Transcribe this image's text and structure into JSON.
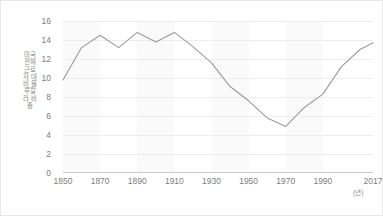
{
  "chart_data": {
    "type": "line",
    "title": "",
    "xlabel": "(년)",
    "ylabel": "미국 전체 근로자 대비 블루칼라 비중",
    "x": [
      1850,
      1860,
      1870,
      1880,
      1890,
      1900,
      1910,
      1920,
      1930,
      1940,
      1950,
      1960,
      1970,
      1980,
      1990,
      2000,
      2010,
      2017
    ],
    "values": [
      9.8,
      13.2,
      14.5,
      13.2,
      14.8,
      13.8,
      14.8,
      13.3,
      11.6,
      9.1,
      7.6,
      5.8,
      4.9,
      6.9,
      8.3,
      11.2,
      13.0,
      13.7
    ],
    "series": [
      {
        "name": "블루칼라 비중",
        "values": [
          9.8,
          13.2,
          14.5,
          13.2,
          14.8,
          13.8,
          14.8,
          13.3,
          11.6,
          9.1,
          7.6,
          5.8,
          4.9,
          6.9,
          8.3,
          11.2,
          13.0,
          13.7
        ],
        "color": "#9a9a9a"
      }
    ],
    "xlim": [
      1850,
      2017
    ],
    "ylim": [
      0,
      16
    ],
    "yticks": [
      "0",
      "2",
      "4",
      "6",
      "8",
      "10",
      "12",
      "14",
      "16"
    ],
    "ytick_values": [
      0,
      2,
      4,
      6,
      8,
      10,
      12,
      14,
      16
    ],
    "xticks": [
      "1850",
      "1870",
      "1890",
      "1910",
      "1930",
      "1950",
      "1970",
      "1990",
      "2017"
    ],
    "xtick_values": [
      1850,
      1870,
      1890,
      1910,
      1930,
      1950,
      1970,
      1990,
      2017
    ],
    "grid": true,
    "grid_axis": "y",
    "legend": "none",
    "bands": [
      {
        "from": 1850,
        "to": 1870
      },
      {
        "from": 1890,
        "to": 1910
      },
      {
        "from": 1930,
        "to": 1950
      },
      {
        "from": 1970,
        "to": 1990
      }
    ],
    "colors": {
      "line": "#9a9a9a",
      "grid": "#ededed",
      "band": "#fafafa",
      "axis": "#c9c9c9",
      "tick_text": "#7d7d7d",
      "axis_title": "#8a8a8a",
      "background": "#ffffff"
    }
  }
}
